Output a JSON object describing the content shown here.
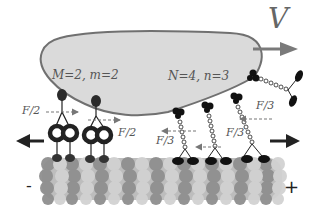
{
  "labels": {
    "velocity": "V",
    "left_group": "M=2, m=2",
    "right_group": "N=4, n=3",
    "force_left_1": "F/2",
    "force_left_2": "F/2",
    "force_right_1": "F/3",
    "force_right_2": "F/3",
    "force_right_3": "F/3",
    "minus_end": "-",
    "plus_end": "+"
  },
  "colors": {
    "cargo_fill": "#d9d9d9",
    "cargo_stroke": "#707070",
    "velocity_arrow": "#7a7a7a",
    "motor_dark": "#111111",
    "dynein_head": "#2a2a2a",
    "mt_dark": "#8c8c8c",
    "mt_light": "#c8c8c8",
    "force_arrow": "#777777"
  }
}
